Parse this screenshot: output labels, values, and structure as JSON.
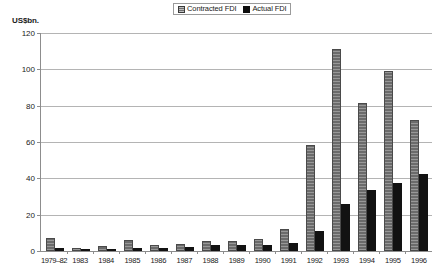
{
  "chart_data": {
    "type": "bar",
    "title": "",
    "subtitle": "",
    "ylabel": "US$bn.",
    "xlabel": "",
    "ylim": [
      0,
      120
    ],
    "yticks": [
      0,
      20,
      40,
      60,
      80,
      100,
      120
    ],
    "ytick_labels": [
      "0",
      "20",
      "40",
      "60",
      "80",
      "100",
      "120"
    ],
    "grid": true,
    "legend_position": "top-center",
    "categories": [
      "1979–82",
      "1983",
      "1984",
      "1985",
      "1986",
      "1987",
      "1988",
      "1989",
      "1990",
      "1991",
      "1992",
      "1993",
      "1994",
      "1995",
      "1996"
    ],
    "series": [
      {
        "name": "Contracted FDI",
        "color": "#6b6b6b",
        "values": [
          7.0,
          1.9,
          2.9,
          6.3,
          3.3,
          3.7,
          5.3,
          5.6,
          6.6,
          12.0,
          58.1,
          111.4,
          81.4,
          99.0,
          72.0
        ]
      },
      {
        "name": "Actual FDI",
        "color": "#121212",
        "values": [
          1.8,
          0.9,
          1.3,
          1.7,
          1.9,
          2.3,
          3.2,
          3.4,
          3.5,
          4.4,
          11.0,
          25.8,
          33.8,
          37.5,
          42.3
        ]
      }
    ]
  },
  "legend": {
    "entries": [
      {
        "label": "Contracted FDI",
        "swatch": "hatched-gray-swatch"
      },
      {
        "label": "Actual FDI",
        "swatch": "solid-black-swatch"
      }
    ]
  }
}
